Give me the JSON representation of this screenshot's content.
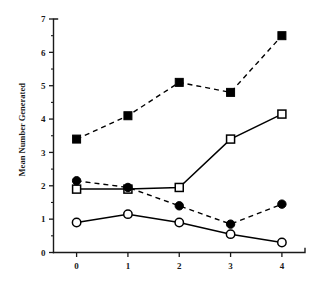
{
  "chart_data": {
    "type": "line",
    "title": "",
    "xlabel": "",
    "ylabel": "Mean Number Generated",
    "x": [
      0,
      1,
      2,
      3,
      4
    ],
    "xticklabels": [
      "0",
      "1",
      "2",
      "3",
      "4"
    ],
    "yticklabels": [
      "0",
      "1",
      "2",
      "3",
      "4",
      "5",
      "6",
      "7"
    ],
    "xlim": [
      -0.45,
      4.45
    ],
    "ylim": [
      0,
      7
    ],
    "grid": false,
    "legend": "none",
    "minor_ticks": true,
    "minor_tick_step": 0.5,
    "series": [
      {
        "name": "filled-square-dashed",
        "marker": "filled-square",
        "linestyle": "dashed",
        "values": [
          3.4,
          4.1,
          5.1,
          4.8,
          6.5
        ]
      },
      {
        "name": "open-square-solid",
        "marker": "open-square",
        "linestyle": "solid",
        "values": [
          1.9,
          1.9,
          1.95,
          3.4,
          4.15
        ]
      },
      {
        "name": "filled-circle-dashed",
        "marker": "filled-circle",
        "linestyle": "dashed",
        "values": [
          2.15,
          1.95,
          1.4,
          0.85,
          1.45
        ]
      },
      {
        "name": "open-circle-solid",
        "marker": "open-circle",
        "linestyle": "solid",
        "values": [
          0.9,
          1.15,
          0.9,
          0.55,
          0.3
        ]
      }
    ]
  }
}
